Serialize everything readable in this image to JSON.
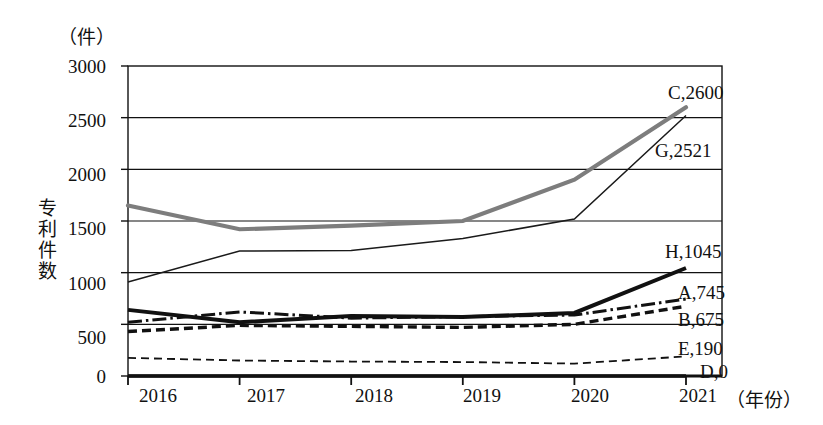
{
  "chart_data": {
    "type": "line",
    "title": "",
    "unit_label": "（件）",
    "ylabel": "专利件数",
    "xlabel": "（年份）",
    "categories": [
      "2016",
      "2017",
      "2018",
      "2019",
      "2020",
      "2021"
    ],
    "x": [
      2016,
      2017,
      2018,
      2019,
      2020,
      2021
    ],
    "ylim": [
      0,
      3000
    ],
    "yticks": [
      "0",
      "500",
      "1000",
      "1500",
      "2000",
      "2500",
      "3000"
    ],
    "ytick_values": [
      0,
      500,
      1000,
      1500,
      2000,
      2500,
      3000
    ],
    "grid": true,
    "legend": "inline-end-labels",
    "series": [
      {
        "name": "C",
        "end_label": "C,2600",
        "end_value": 2600,
        "style": "thick-gray-solid",
        "color": "#7d7d7d",
        "values": [
          1650,
          1420,
          1455,
          1500,
          1900,
          2600
        ]
      },
      {
        "name": "G",
        "end_label": "G,2521",
        "end_value": 2521,
        "style": "thin-black-solid",
        "color": "#1a1a1a",
        "values": [
          910,
          1210,
          1215,
          1330,
          1520,
          2521
        ]
      },
      {
        "name": "H",
        "end_label": "H,1045",
        "end_value": 1045,
        "style": "thick-black-solid",
        "color": "#111111",
        "values": [
          640,
          520,
          580,
          570,
          610,
          1045
        ]
      },
      {
        "name": "A",
        "end_label": "A,745",
        "end_value": 745,
        "style": "black-dash-dot",
        "color": "#111111",
        "values": [
          520,
          620,
          560,
          575,
          590,
          745
        ]
      },
      {
        "name": "B",
        "end_label": "B,675",
        "end_value": 675,
        "style": "thick-black-dashed",
        "color": "#111111",
        "values": [
          430,
          490,
          480,
          470,
          500,
          675
        ]
      },
      {
        "name": "E",
        "end_label": "E,190",
        "end_value": 190,
        "style": "thin-black-dashed",
        "color": "#111111",
        "values": [
          175,
          150,
          140,
          135,
          120,
          190
        ]
      },
      {
        "name": "D",
        "end_label": "D,0",
        "end_value": 0,
        "style": "thick-black-baseline",
        "color": "#111111",
        "values": [
          0,
          0,
          0,
          0,
          0,
          0
        ]
      }
    ]
  }
}
